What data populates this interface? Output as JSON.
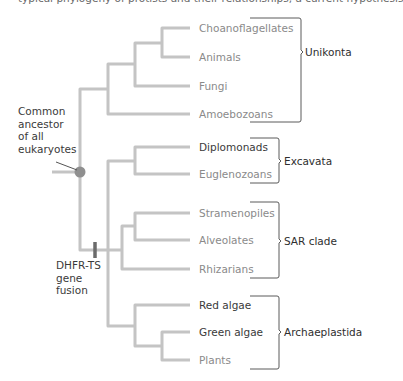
{
  "header": {
    "cut_off_text": "typical phylogeny of protists and their relationships, a current hypothesis"
  },
  "tree": {
    "branch_color": "#c4c4c4",
    "node_color": "#8f8f8f",
    "marker_color": "#6b6b6b",
    "taxa": [
      {
        "name": "Choanoflagellates",
        "tone": "grey"
      },
      {
        "name": "Animals",
        "tone": "grey"
      },
      {
        "name": "Fungi",
        "tone": "grey"
      },
      {
        "name": "Amoebozoans",
        "tone": "grey"
      },
      {
        "name": "Diplomonads",
        "tone": "dark"
      },
      {
        "name": "Euglenozoans",
        "tone": "grey"
      },
      {
        "name": "Stramenopiles",
        "tone": "grey"
      },
      {
        "name": "Alveolates",
        "tone": "grey"
      },
      {
        "name": "Rhizarians",
        "tone": "grey"
      },
      {
        "name": "Red algae",
        "tone": "dark"
      },
      {
        "name": "Green algae",
        "tone": "dark"
      },
      {
        "name": "Plants",
        "tone": "grey"
      }
    ],
    "groups": [
      {
        "name": "Unikonta"
      },
      {
        "name": "Excavata"
      },
      {
        "name": "SAR clade"
      },
      {
        "name": "Archaeplastida"
      }
    ],
    "annotations": {
      "root_label": [
        "Common",
        "ancestor",
        "of all",
        "eukaryotes"
      ],
      "fusion_label": [
        "DHFR-TS",
        "gene",
        "fusion"
      ]
    }
  }
}
